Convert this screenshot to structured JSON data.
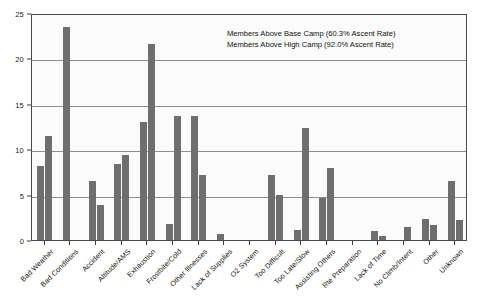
{
  "chart_data": {
    "type": "bar",
    "title": "",
    "subtitle": "",
    "xlabel": "",
    "ylabel": "",
    "ylim": [
      0,
      25
    ],
    "yticks": [
      0,
      5,
      10,
      15,
      20,
      25
    ],
    "grid": true,
    "legend_position": "top-right",
    "categories": [
      "Bad Weather",
      "Bad Conditions",
      "Accident",
      "Altitude/AMS",
      "Exhaustion",
      "Frostbite/Cold",
      "Other Illnesses",
      "Lack of Supplies",
      "O2 System",
      "Too Difficult",
      "Too Late/Slow",
      "Assisting Others",
      "Rte Preparation",
      "Lack of Time",
      "No Climb/Intent",
      "Other",
      "Unknown"
    ],
    "series": [
      {
        "name": "Members Above Base Camp (60.3% Ascent Rate)",
        "color": "#6e6e6e",
        "values": [
          8.1,
          23.5,
          6.5,
          8.4,
          13.0,
          1.8,
          13.7,
          0.7,
          0.0,
          7.2,
          1.1,
          4.6,
          0.0,
          1.0,
          0.0,
          2.3,
          6.5
        ]
      },
      {
        "name": "Members Above High Camp (92.0% Ascent Rate)",
        "color": "#6e6e6e",
        "values": [
          11.5,
          0.0,
          3.9,
          9.4,
          21.6,
          13.7,
          7.2,
          0.0,
          0.0,
          5.0,
          12.3,
          7.9,
          0.0,
          0.4,
          1.4,
          1.7,
          2.2
        ]
      }
    ],
    "legend": [
      "Members Above Base Camp (60.3% Ascent Rate)",
      "Members Above High Camp (92.0% Ascent Rate)"
    ],
    "annotations": []
  },
  "style": {
    "bar_color": "#6e6e6e",
    "grid_color": "#8e8e8e",
    "frame_color": "#4a4a4a",
    "plot_background": "#fbfbfb",
    "text_color": "#111111"
  }
}
